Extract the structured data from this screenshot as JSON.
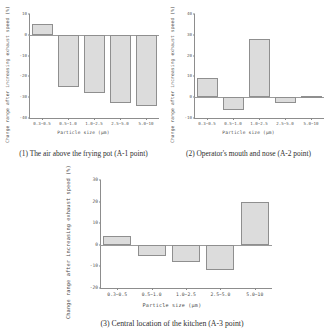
{
  "figure": {
    "background_color": "#ffffff",
    "bar_fill_color": "#dcdcdc",
    "bar_edge_color": "#8f8f8f",
    "axis_color": "#8d8d8d"
  },
  "panels": [
    {
      "caption": "(1) The air above the frying pot (A-1 point)",
      "chart_data": {
        "type": "bar",
        "title": "",
        "categories": [
          "0.3~0.5",
          "0.5~1.0",
          "1.0~2.5",
          "2.5~5.0",
          "5.0~10"
        ],
        "values": [
          5,
          -25,
          -28,
          -33,
          -34
        ],
        "xlabel": "Particle size (μm)",
        "ylabel": "Change range after increasing exhaust speed (%)",
        "ylim": [
          -40,
          10
        ],
        "yticks": [
          10,
          0,
          -10,
          -20,
          -30,
          -40
        ],
        "ytick_labels": [
          "10",
          "0",
          "-10",
          "-20",
          "-30",
          "-40"
        ],
        "grid": false,
        "legend": "none"
      }
    },
    {
      "caption": "(2) Operator's mouth and nose (A-2 point)",
      "chart_data": {
        "type": "bar",
        "title": "",
        "categories": [
          "0.3~0.5",
          "0.5~1.0",
          "1.0~2.5",
          "2.5~5.0",
          "5.0~10"
        ],
        "values": [
          9,
          -6,
          28,
          -3,
          0.5
        ],
        "xlabel": "Particle size (μm)",
        "ylabel": "Change range after increasing exhaust speed (%)",
        "ylim": [
          -10,
          40
        ],
        "yticks": [
          40,
          30,
          20,
          10,
          0,
          -10
        ],
        "ytick_labels": [
          "40",
          "30",
          "20",
          "10",
          "0",
          "-10"
        ],
        "grid": false,
        "legend": "none"
      }
    },
    {
      "caption": "(3) Central location of the kitchen (A-3 point)",
      "chart_data": {
        "type": "bar",
        "title": "",
        "categories": [
          "0.3~0.5",
          "0.5~1.0",
          "1.0~2.5",
          "2.5~5.0",
          "5.0~10"
        ],
        "values": [
          4,
          -5,
          -8,
          -11.5,
          20
        ],
        "xlabel": "Particle size (μm)",
        "ylabel": "Change range after increasing exhaust speed (%)",
        "ylim": [
          -20,
          30
        ],
        "yticks": [
          30,
          20,
          10,
          0,
          -10,
          -20
        ],
        "ytick_labels": [
          "30",
          "20",
          "10",
          "0",
          "-10",
          "-20"
        ],
        "grid": false,
        "legend": "none"
      }
    }
  ]
}
